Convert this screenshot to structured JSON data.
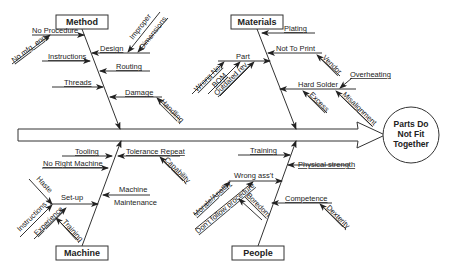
{
  "effect": {
    "line1": "Parts Do",
    "line2": "Not Fit",
    "line3": "Together"
  },
  "categories": {
    "method": {
      "title": "Method",
      "causes": {
        "no_procedure": "No Procedure",
        "no_mfg_eng": "No mfg. eng.",
        "design": "Design",
        "improper": "Improper",
        "dimensions": "Dimensions",
        "instructions": "Instructions",
        "routing": "Routing",
        "threads": "Threads",
        "damage": "Damage",
        "handling": "Handling"
      }
    },
    "materials": {
      "title": "Materials",
      "causes": {
        "plating": "Plating",
        "not_to_print": "Not To Print",
        "vendor": "Vendor",
        "part": "Part",
        "wrong_no": "Wrong No.",
        "bom": "BOM",
        "outdated_rev": "Outdated rev.",
        "overheating": "Overheating",
        "hard_solder": "Hard Solder",
        "excess": "Excess",
        "misalignment": "Misalignment"
      }
    },
    "machine": {
      "title": "Machine",
      "causes": {
        "tooling": "Tooling",
        "tolerance_repeat": "Tolerance Repeat",
        "capability": "Capability",
        "no_right_machine": "No Right Machine",
        "haste": "Haste",
        "set_up": "Set-up",
        "instructions": "Instructions",
        "experience": "Experience",
        "training": "Training",
        "machine_maintenance_1": "Machine",
        "machine_maintenance_2": "Maintenance"
      }
    },
    "people": {
      "title": "People",
      "causes": {
        "training": "Training",
        "physical_strength": "Physical strength",
        "wrong_ass": "Wrong ass't",
        "morale_apathy": "Morale/Apathy",
        "dont_follow": "Don't follow procedure",
        "boredom": "Boredom",
        "competence": "Competence",
        "dexterity": "Dexterity"
      }
    }
  }
}
